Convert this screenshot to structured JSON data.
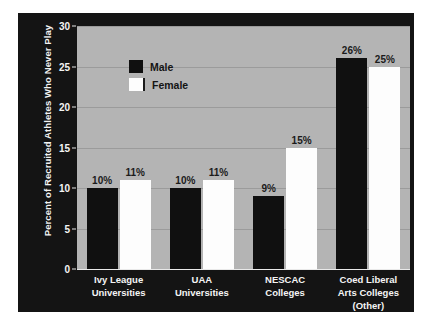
{
  "chart_data": {
    "type": "bar",
    "title": "",
    "subtitle": "",
    "xlabel": "",
    "ylabel": "Percent of Recruited Athletes Who Never Play",
    "ylim": [
      0,
      30
    ],
    "yticks": [
      0,
      5,
      10,
      15,
      20,
      25,
      30
    ],
    "ytick_labels": [
      "0",
      "5",
      "10",
      "15",
      "20",
      "25",
      "30"
    ],
    "grid": true,
    "legend_position": "top-left",
    "categories": [
      "Ivy League Universities",
      "UAA Universities",
      "NESCAC Colleges",
      "Coed Liberal Arts Colleges (Other)"
    ],
    "category_lines": [
      [
        "Ivy League",
        "Universities"
      ],
      [
        "UAA",
        "Universities"
      ],
      [
        "NESCAC",
        "Colleges"
      ],
      [
        "Coed Liberal",
        "Arts Colleges",
        "(Other)"
      ]
    ],
    "series": [
      {
        "name": "Male",
        "color": "#101010",
        "values": [
          10,
          10,
          9,
          26
        ],
        "value_labels": [
          "10%",
          "10%",
          "9%",
          "26%"
        ]
      },
      {
        "name": "Female",
        "color": "#fdfdfd",
        "values": [
          11,
          11,
          15,
          25
        ],
        "value_labels": [
          "11%",
          "11%",
          "15%",
          "25%"
        ]
      }
    ],
    "colors": {
      "panel_background": "#141414",
      "plot_background": "#b4b4b4",
      "gridline": "#9b9b9b",
      "axis": "#e9e9e9",
      "tick_text": "#f4f4f4",
      "category_text": "#f4f4f4",
      "value_label_text": "#1b1b1b",
      "legend_text": "#141414",
      "male": "#101010",
      "female": "#fdfdfd",
      "page_background": "#ffffff"
    }
  },
  "legend": {
    "items": [
      {
        "label": "Male"
      },
      {
        "label": "Female"
      }
    ]
  }
}
